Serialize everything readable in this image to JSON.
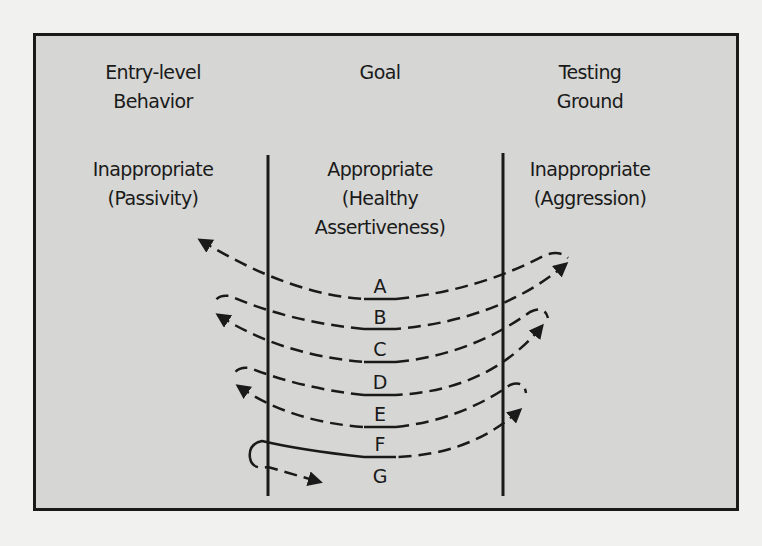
{
  "columns": [
    {
      "heading": "Entry-level\nBehavior",
      "category": "Inappropriate\n(Passivity)"
    },
    {
      "heading": "Goal",
      "category": "Appropriate\n(Healthy\nAssertiveness)"
    },
    {
      "heading": "Testing\nGround",
      "category": "Inappropriate\n(Aggression)"
    }
  ],
  "steps": [
    "A",
    "B",
    "C",
    "D",
    "E",
    "F",
    "G"
  ],
  "colors": {
    "frame_fill": "#d6d6d4",
    "line": "#1a1a1a",
    "background": "#f1f1ef"
  },
  "icons": [
    "dashed-swing-arrow",
    "arrowhead-icon"
  ]
}
